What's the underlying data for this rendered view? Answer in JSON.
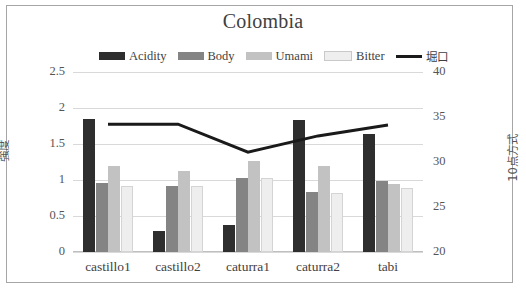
{
  "chart_data": {
    "type": "bar",
    "title": "Colombia",
    "categories": [
      "castillo1",
      "castillo2",
      "caturra1",
      "caturra2",
      "tabi"
    ],
    "series": [
      {
        "name": "Acidity",
        "type": "bar",
        "axis": "left",
        "color": "#2e2e2e",
        "values": [
          1.85,
          0.29,
          0.37,
          1.83,
          1.64
        ]
      },
      {
        "name": "Body",
        "type": "bar",
        "axis": "left",
        "color": "#848484",
        "values": [
          0.96,
          0.91,
          1.03,
          0.83,
          0.98
        ]
      },
      {
        "name": "Umami",
        "type": "bar",
        "axis": "left",
        "color": "#c2c2c2",
        "values": [
          1.2,
          1.13,
          1.27,
          1.19,
          0.95
        ]
      },
      {
        "name": "Bitter",
        "type": "bar",
        "axis": "left",
        "color": "#eeeeee",
        "values": [
          0.91,
          0.92,
          1.03,
          0.82,
          0.89
        ]
      },
      {
        "name": "堀口",
        "type": "line",
        "axis": "right",
        "color": "#1a1a1a",
        "values": [
          34.2,
          34.2,
          31.1,
          32.9,
          34.1
        ]
      }
    ],
    "xlabel": "",
    "ylabel": "強度",
    "ylabel_right": "10点方式",
    "ylim": [
      0,
      2.5
    ],
    "ylim_right": [
      20,
      40
    ],
    "yticks": [
      "0",
      "0.5",
      "1",
      "1.5",
      "2",
      "2.5"
    ],
    "yticks_right": [
      "20",
      "25",
      "30",
      "35",
      "40"
    ],
    "grid": true,
    "legend_position": "top"
  },
  "legend": {
    "entries": [
      {
        "label": "Acidity",
        "swatch": "bar",
        "color": "#2e2e2e"
      },
      {
        "label": "Body",
        "swatch": "bar",
        "color": "#848484"
      },
      {
        "label": "Umami",
        "swatch": "bar",
        "color": "#c2c2c2"
      },
      {
        "label": "Bitter",
        "swatch": "bar",
        "color": "#eeeeee"
      },
      {
        "label": "堀口",
        "swatch": "line",
        "color": "#1a1a1a"
      }
    ]
  }
}
